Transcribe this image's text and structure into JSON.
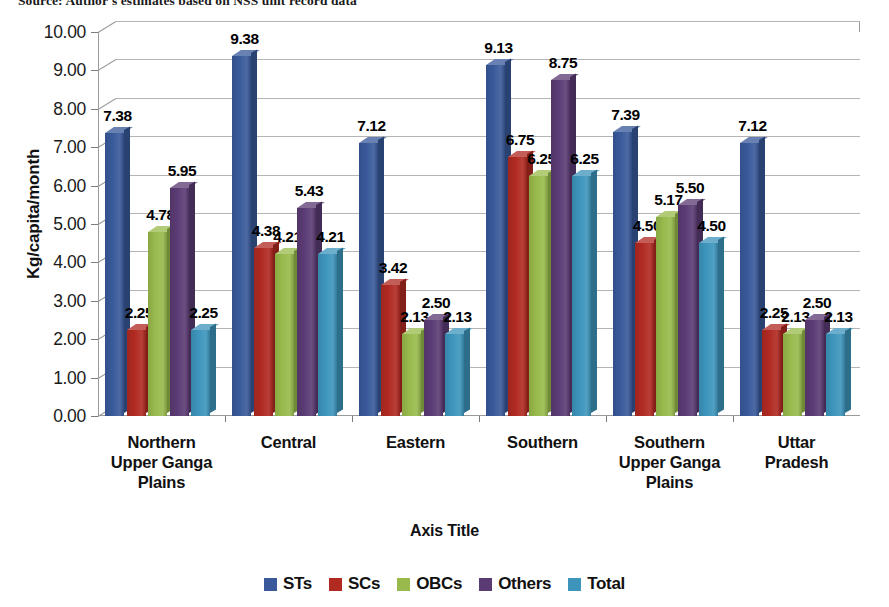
{
  "source_note": "Source: Author's estimates based on NSS unit record data",
  "chart_data": {
    "type": "bar",
    "title": "",
    "xlabel": "Axis Title",
    "ylabel": "Kg/capita/month",
    "ylim": [
      0,
      10
    ],
    "ytick_step": 1,
    "yticks": [
      "10.00",
      "9.00",
      "8.00",
      "7.00",
      "6.00",
      "5.00",
      "4.00",
      "3.00",
      "2.00",
      "1.00",
      "0.00"
    ],
    "grid": true,
    "legend_position": "bottom",
    "three_d": true,
    "categories": [
      "Northern Upper Ganga Plains",
      "Central",
      "Eastern",
      "Southern",
      "Southern Upper Ganga Plains",
      "Uttar Pradesh"
    ],
    "category_lines": [
      [
        "Northern",
        "Upper Ganga",
        "Plains"
      ],
      [
        "Central"
      ],
      [
        "Eastern"
      ],
      [
        "Southern"
      ],
      [
        "Southern",
        "Upper Ganga",
        "Plains"
      ],
      [
        "Uttar",
        "Pradesh"
      ]
    ],
    "series": [
      {
        "name": "STs",
        "color": "#39599A",
        "values": [
          7.38,
          9.38,
          7.12,
          9.13,
          7.39,
          7.12
        ]
      },
      {
        "name": "SCs",
        "color": "#B02A22",
        "values": [
          2.25,
          4.38,
          3.42,
          6.75,
          4.5,
          2.25
        ]
      },
      {
        "name": "OBCs",
        "color": "#98BA4C",
        "values": [
          4.78,
          4.21,
          2.13,
          6.25,
          5.17,
          2.13
        ]
      },
      {
        "name": "Others",
        "color": "#5B3B74",
        "values": [
          5.95,
          5.43,
          2.5,
          8.75,
          5.5,
          2.5
        ]
      },
      {
        "name": "Total",
        "color": "#3D95BC",
        "values": [
          2.25,
          4.21,
          2.13,
          6.25,
          4.5,
          2.13
        ]
      }
    ],
    "data_labels": [
      [
        "7.38",
        "2.25",
        "4.78",
        "5.95",
        "2.25"
      ],
      [
        "9.38",
        "4.38",
        "4.21",
        "5.43",
        "4.21"
      ],
      [
        "7.12",
        "3.42",
        "2.13",
        "2.50",
        "2.13"
      ],
      [
        "9.13",
        "6.75",
        "6.25",
        "8.75",
        "6.25"
      ],
      [
        "7.39",
        "4.50",
        "5.17",
        "5.50",
        "4.50"
      ],
      [
        "7.12",
        "2.25",
        "2.13",
        "2.50",
        "2.13"
      ]
    ]
  }
}
